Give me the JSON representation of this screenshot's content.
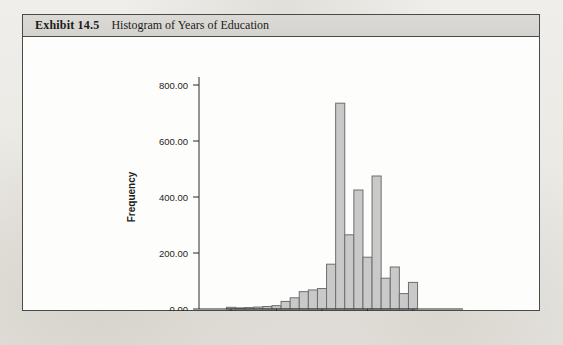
{
  "exhibit": {
    "number": "Exhibit 14.5",
    "caption": "Histogram of Years of Education"
  },
  "chart_data": {
    "type": "bar",
    "title": "Histogram of Years of Education",
    "xlabel": "",
    "ylabel": "Frequency",
    "xlim": [
      -1.5,
      21.5
    ],
    "ylim": [
      0,
      800
    ],
    "grid": false,
    "legend": null,
    "xticks": [
      0,
      5,
      10,
      15,
      20
    ],
    "xtick_labels": [
      "0",
      "5",
      "10",
      "15",
      "20"
    ],
    "yticks": [
      0,
      200,
      400,
      600,
      800
    ],
    "ytick_labels": [
      "0.00",
      "200.00",
      "400.00",
      "600.00",
      "600.00"
    ],
    "ytick_labels_actual": [
      "0.00",
      "200.00",
      "400.00",
      "600.00",
      "800.00"
    ],
    "bar_fill": "#c9c9c9",
    "bar_stroke": "#6e6e6e",
    "categories": [
      0,
      1,
      2,
      3,
      4,
      5,
      6,
      7,
      8,
      9,
      10,
      11,
      12,
      13,
      14,
      15,
      16,
      17,
      18,
      19,
      20
    ],
    "values": [
      6,
      4,
      5,
      7,
      9,
      12,
      27,
      40,
      62,
      68,
      73,
      160,
      735,
      265,
      425,
      185,
      475,
      110,
      150,
      55,
      95
    ]
  }
}
